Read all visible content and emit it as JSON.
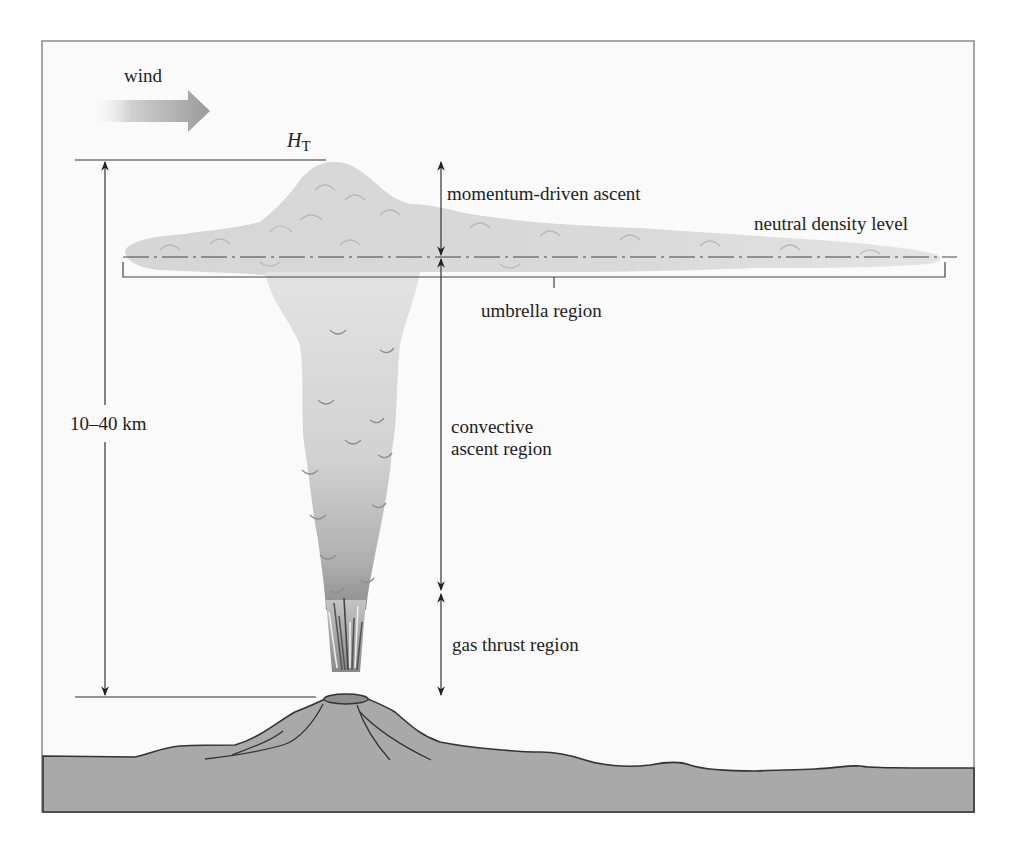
{
  "figure": {
    "colors": {
      "frame": "#8a8a8a",
      "sky": "#fafafa",
      "ground": "#a9a9a9",
      "plume_light": "#dcdcdc",
      "plume_dark": "#a0a0a0",
      "annotation": "#333333",
      "text": "#222222"
    }
  },
  "labels": {
    "wind": "wind",
    "top_height_symbol": "H",
    "top_height_subscript": "T",
    "momentum": "momentum-driven ascent",
    "neutral_density": "neutral density level",
    "umbrella": "umbrella region",
    "height_range": "10–40 km",
    "convective_line1": "convective",
    "convective_line2": "ascent region",
    "gas_thrust": "gas thrust region"
  },
  "annotations": {
    "height_arrow": {
      "x": 105,
      "y_top": 160,
      "y_bottom": 697
    },
    "region_arrow_x": 441,
    "top_level_y": 160,
    "neutral_level_y": 257,
    "convective_bottom_y": 592,
    "vent_level_y": 697
  }
}
